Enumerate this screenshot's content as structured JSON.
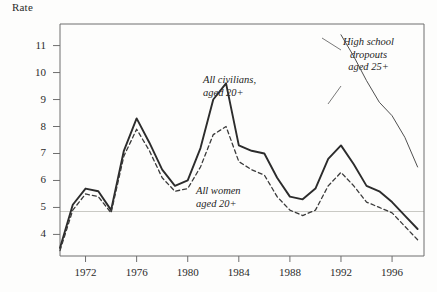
{
  "figure": {
    "y_axis_title": "Rate",
    "background": "#fdfdfc",
    "frame_color": "#6e6e6e"
  },
  "annotations": {
    "civilians": "All civilians,\naged 20+",
    "women": "All women\naged 20+",
    "dropouts": "High school\ndropouts\naged 25+"
  },
  "axes": {
    "y_ticks": [
      "4",
      "5",
      "6",
      "7",
      "8",
      "9",
      "10",
      "11"
    ],
    "x_ticks": [
      "1972",
      "1976",
      "1980",
      "1984",
      "1988",
      "1992",
      "1996"
    ]
  },
  "chart_data": {
    "type": "line",
    "title": "",
    "xlabel": "",
    "ylabel": "Rate",
    "xlim": [
      1970,
      1998.5
    ],
    "ylim": [
      3.2,
      11.8
    ],
    "grid": "single faint horizontal rule near 4.85",
    "gridline_value": 4.85,
    "legend": "inline annotations",
    "series": [
      {
        "name": "All civilians, aged 20+",
        "style": "solid",
        "color": "#2c2c2c",
        "x": [
          1970,
          1971,
          1972,
          1973,
          1974,
          1975,
          1976,
          1977,
          1978,
          1979,
          1980,
          1981,
          1982,
          1983,
          1984,
          1985,
          1986,
          1987,
          1988,
          1989,
          1990,
          1991,
          1992,
          1993,
          1994,
          1995,
          1996,
          1997,
          1998
        ],
        "values": [
          3.5,
          5.1,
          5.7,
          5.6,
          4.9,
          7.1,
          8.3,
          7.4,
          6.4,
          5.8,
          6.0,
          7.2,
          9.0,
          9.6,
          7.3,
          7.1,
          7.0,
          6.1,
          5.4,
          5.3,
          5.7,
          6.8,
          7.3,
          6.6,
          5.8,
          5.6,
          5.2,
          4.7,
          4.2
        ],
        "y_at_start": 3.5,
        "peak_value": 9.6,
        "peak_year": 1983
      },
      {
        "name": "All women, aged 20+",
        "style": "dashed",
        "color": "#3a3a3a",
        "x": [
          1970,
          1971,
          1972,
          1973,
          1974,
          1975,
          1976,
          1977,
          1978,
          1979,
          1980,
          1981,
          1982,
          1983,
          1984,
          1985,
          1986,
          1987,
          1988,
          1989,
          1990,
          1991,
          1992,
          1993,
          1994,
          1995,
          1996,
          1997,
          1998
        ],
        "values": [
          3.4,
          4.9,
          5.5,
          5.4,
          4.8,
          6.9,
          7.9,
          7.1,
          6.1,
          5.6,
          5.7,
          6.5,
          7.7,
          8.0,
          6.7,
          6.4,
          6.2,
          5.4,
          4.9,
          4.7,
          4.9,
          5.8,
          6.3,
          5.8,
          5.2,
          5.0,
          4.8,
          4.3,
          3.8
        ],
        "peak_value": 8.0,
        "peak_year": 1983
      },
      {
        "name": "High school dropouts, aged 25+",
        "style": "solid-thin",
        "color": "#505050",
        "x": [
          1992,
          1993,
          1994,
          1995,
          1996,
          1997,
          1998
        ],
        "values": [
          11.4,
          10.6,
          9.7,
          8.9,
          8.4,
          7.6,
          6.5
        ],
        "note": "partial series, right portion only"
      }
    ]
  }
}
